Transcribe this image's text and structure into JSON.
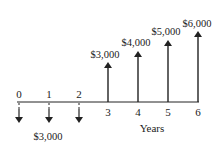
{
  "diagram": {
    "type": "cash-flow-diagram",
    "axis_label": "Years",
    "periods": [
      "0",
      "1",
      "2",
      "3",
      "4",
      "5",
      "6"
    ],
    "outflows": [
      {
        "period": "0",
        "amount": 3000
      },
      {
        "period": "1",
        "amount": 3000
      },
      {
        "period": "2",
        "amount": 3000
      }
    ],
    "outflow_label": "$3,000",
    "inflows": [
      {
        "period": "3",
        "amount": 3000,
        "label": "$3,000"
      },
      {
        "period": "4",
        "amount": 4000,
        "label": "$4,000"
      },
      {
        "period": "5",
        "amount": 5000,
        "label": "$5,000"
      },
      {
        "period": "6",
        "amount": 6000,
        "label": "$6,000"
      }
    ],
    "colors": {
      "line": "#222222",
      "background": "#ffffff"
    }
  }
}
